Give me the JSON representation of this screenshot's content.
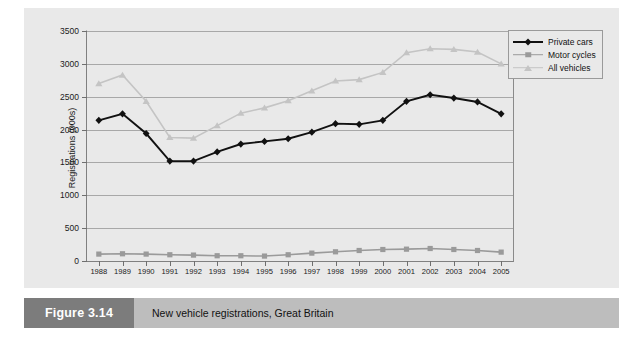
{
  "figure": {
    "number_label": "Figure 3.14",
    "caption": "New vehicle registrations, Great Britain"
  },
  "colors": {
    "panel_background": "#e9e9e9",
    "gridline": "#a8a8a8",
    "axis": "#808080",
    "private_cars": "#111111",
    "motor_cycles": "#9a9a9a",
    "all_vehicles": "#c4c4c4",
    "caption_bar": "#bdbdbd",
    "figure_number_box": "#7c7c7c"
  },
  "legend": {
    "position": "top-right-outside",
    "entries": [
      {
        "label": "Private cars",
        "marker": "diamond",
        "color": "#111111"
      },
      {
        "label": "Motor cycles",
        "marker": "square",
        "color": "#9a9a9a"
      },
      {
        "label": "All vehicles",
        "marker": "triangle",
        "color": "#c4c4c4"
      }
    ]
  },
  "chart_data": {
    "type": "line",
    "title": "",
    "xlabel": "",
    "ylabel": "Registrations (000s)",
    "grid": true,
    "legend_position": "top-right-outside",
    "ylim": [
      0,
      3500
    ],
    "yticks": [
      0,
      500,
      1000,
      1500,
      2000,
      2500,
      3000,
      3500
    ],
    "ytick_labels": [
      "0",
      "500",
      "1000",
      "1500",
      "2000",
      "2500",
      "3000",
      "3500"
    ],
    "categories": [
      "1988",
      "1989",
      "1990",
      "1991",
      "1992",
      "1993",
      "1994",
      "1995",
      "1996",
      "1997",
      "1998",
      "1999",
      "2000",
      "2001",
      "2002",
      "2003",
      "2004",
      "2005"
    ],
    "series": [
      {
        "name": "Private cars",
        "marker": "diamond",
        "color": "#111111",
        "values": [
          2140,
          2240,
          1940,
          1520,
          1520,
          1660,
          1780,
          1820,
          1860,
          1960,
          2090,
          2080,
          2140,
          2430,
          2530,
          2480,
          2420,
          2240
        ]
      },
      {
        "name": "Motor cycles",
        "marker": "square",
        "color": "#9a9a9a",
        "values": [
          105,
          110,
          105,
          95,
          90,
          80,
          80,
          75,
          95,
          120,
          140,
          160,
          175,
          180,
          190,
          175,
          160,
          135
        ]
      },
      {
        "name": "All vehicles",
        "marker": "triangle",
        "color": "#c4c4c4",
        "values": [
          2700,
          2830,
          2430,
          1880,
          1870,
          2060,
          2250,
          2330,
          2440,
          2590,
          2740,
          2760,
          2870,
          3170,
          3230,
          3220,
          3180,
          3000
        ]
      }
    ]
  }
}
